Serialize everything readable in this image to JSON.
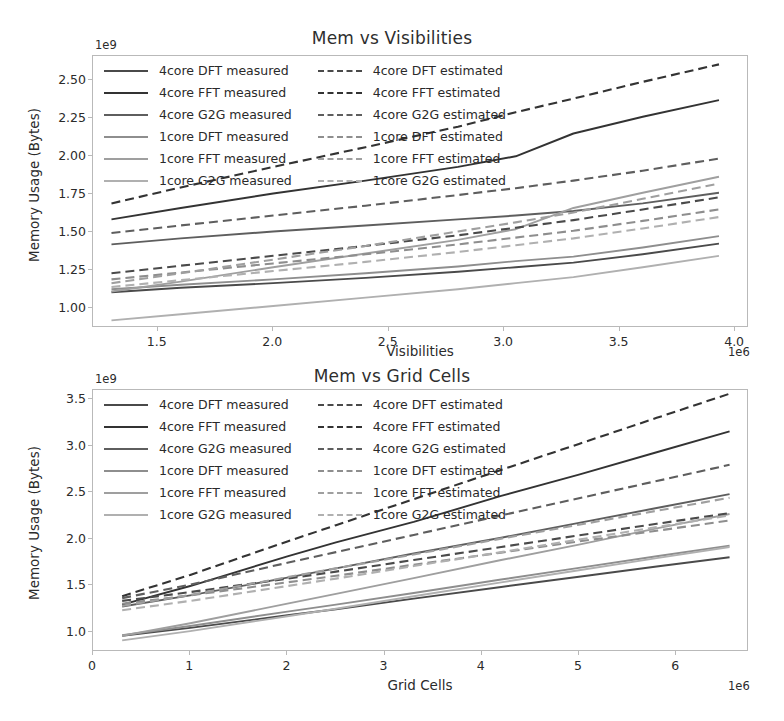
{
  "figure": {
    "figure_title": "Memory scaling plots",
    "axis_label_y": "Memory Usage (Bytes)"
  },
  "charts": [
    {
      "id": "visibilities",
      "title": "Mem vs Visibilities",
      "xlabel": "Visibilities",
      "ylabel": "Memory Usage (Bytes)",
      "y_offset_text": "1e9",
      "x_offset_text": "1e6",
      "yticks": [
        "1.00",
        "1.25",
        "1.50",
        "1.75",
        "2.00",
        "2.25",
        "2.50"
      ],
      "xticks": [
        "1.5",
        "2.0",
        "2.5",
        "3.0",
        "3.5",
        "4.0"
      ],
      "legend": [
        {
          "label": "4core DFT measured",
          "style": "solid",
          "color": "#4a4a4a"
        },
        {
          "label": "4core FFT measured",
          "style": "solid",
          "color": "#333333"
        },
        {
          "label": "4core G2G measured",
          "style": "solid",
          "color": "#5e5e5e"
        },
        {
          "label": "1core DFT measured",
          "style": "solid",
          "color": "#8e8e8e"
        },
        {
          "label": "1core FFT measured",
          "style": "solid",
          "color": "#9f9f9f"
        },
        {
          "label": "1core G2G measured",
          "style": "solid",
          "color": "#b0b0b0"
        },
        {
          "label": "4core DFT estimated",
          "style": "dashed",
          "color": "#4a4a4a"
        },
        {
          "label": "4core FFT estimated",
          "style": "dashed",
          "color": "#333333"
        },
        {
          "label": "4core G2G estimated",
          "style": "dashed",
          "color": "#5e5e5e"
        },
        {
          "label": "1core DFT estimated",
          "style": "dashed",
          "color": "#8e8e8e"
        },
        {
          "label": "1core FFT estimated",
          "style": "dashed",
          "color": "#9f9f9f"
        },
        {
          "label": "1core G2G estimated",
          "style": "dashed",
          "color": "#b0b0b0"
        }
      ]
    },
    {
      "id": "gridcells",
      "title": "Mem vs Grid Cells",
      "xlabel": "Grid Cells",
      "ylabel": "Memory Usage (Bytes)",
      "y_offset_text": "1e9",
      "x_offset_text": "1e6",
      "yticks": [
        "1.0",
        "1.5",
        "2.0",
        "2.5",
        "3.0",
        "3.5"
      ],
      "xticks": [
        "0",
        "1",
        "2",
        "3",
        "4",
        "5",
        "6"
      ],
      "legend": [
        {
          "label": "4core DFT measured",
          "style": "solid",
          "color": "#4a4a4a"
        },
        {
          "label": "4core FFT measured",
          "style": "solid",
          "color": "#333333"
        },
        {
          "label": "4core G2G measured",
          "style": "solid",
          "color": "#5e5e5e"
        },
        {
          "label": "1core DFT measured",
          "style": "solid",
          "color": "#8e8e8e"
        },
        {
          "label": "1core FFT measured",
          "style": "solid",
          "color": "#9f9f9f"
        },
        {
          "label": "1core G2G measured",
          "style": "solid",
          "color": "#b0b0b0"
        },
        {
          "label": "4core DFT estimated",
          "style": "dashed",
          "color": "#4a4a4a"
        },
        {
          "label": "4core FFT estimated",
          "style": "dashed",
          "color": "#333333"
        },
        {
          "label": "4core G2G estimated",
          "style": "dashed",
          "color": "#5e5e5e"
        },
        {
          "label": "1core DFT estimated",
          "style": "dashed",
          "color": "#8e8e8e"
        },
        {
          "label": "1core FFT estimated",
          "style": "dashed",
          "color": "#9f9f9f"
        },
        {
          "label": "1core G2G estimated",
          "style": "dashed",
          "color": "#b0b0b0"
        }
      ]
    }
  ],
  "chart_data": [
    {
      "type": "line",
      "title": "Mem vs Visibilities",
      "xlabel": "Visibilities",
      "ylabel": "Memory Usage (Bytes)",
      "x_offset": "1e6",
      "y_offset": "1e9",
      "xlim": [
        1.22,
        4.06
      ],
      "ylim": [
        0.87,
        2.66
      ],
      "xticks": [
        1.5,
        2.0,
        2.5,
        3.0,
        3.5,
        4.0
      ],
      "yticks": [
        1.0,
        1.25,
        1.5,
        1.75,
        2.0,
        2.25,
        2.5
      ],
      "grid": false,
      "legend_position": "upper-left",
      "x": [
        1.3,
        1.6,
        2.0,
        2.4,
        2.8,
        3.05,
        3.3,
        3.6,
        3.93
      ],
      "series": [
        {
          "name": "4core DFT measured",
          "style": "solid",
          "color": "#4a4a4a",
          "values": [
            1.105,
            1.135,
            1.165,
            1.2,
            1.24,
            1.27,
            1.3,
            1.355,
            1.425
          ]
        },
        {
          "name": "4core FFT measured",
          "style": "solid",
          "color": "#333333",
          "values": [
            1.585,
            1.66,
            1.755,
            1.84,
            1.93,
            2.0,
            2.15,
            2.26,
            2.37
          ]
        },
        {
          "name": "4core G2G measured",
          "style": "solid",
          "color": "#5e5e5e",
          "values": [
            1.42,
            1.46,
            1.505,
            1.545,
            1.585,
            1.61,
            1.64,
            1.69,
            1.76
          ]
        },
        {
          "name": "1core DFT measured",
          "style": "solid",
          "color": "#8e8e8e",
          "values": [
            1.125,
            1.155,
            1.19,
            1.23,
            1.275,
            1.31,
            1.34,
            1.4,
            1.475
          ]
        },
        {
          "name": "1core FFT measured",
          "style": "solid",
          "color": "#9f9f9f",
          "values": [
            1.11,
            1.175,
            1.27,
            1.36,
            1.45,
            1.52,
            1.66,
            1.76,
            1.865
          ]
        },
        {
          "name": "1core G2G measured",
          "style": "solid",
          "color": "#b0b0b0",
          "values": [
            0.92,
            0.96,
            1.015,
            1.07,
            1.125,
            1.165,
            1.205,
            1.27,
            1.345
          ]
        },
        {
          "name": "4core DFT estimated",
          "style": "dashed",
          "color": "#4a4a4a",
          "values": [
            1.23,
            1.28,
            1.345,
            1.41,
            1.48,
            1.53,
            1.58,
            1.65,
            1.73
          ]
        },
        {
          "name": "4core FFT estimated",
          "style": "dashed",
          "color": "#333333",
          "values": [
            1.69,
            1.795,
            1.93,
            2.06,
            2.195,
            2.29,
            2.38,
            2.49,
            2.605
          ]
        },
        {
          "name": "4core G2G estimated",
          "style": "dashed",
          "color": "#5e5e5e",
          "values": [
            1.495,
            1.545,
            1.61,
            1.675,
            1.745,
            1.79,
            1.84,
            1.905,
            1.985
          ]
        },
        {
          "name": "1core DFT estimated",
          "style": "dashed",
          "color": "#8e8e8e",
          "values": [
            1.19,
            1.235,
            1.295,
            1.355,
            1.42,
            1.465,
            1.51,
            1.575,
            1.65
          ]
        },
        {
          "name": "1core FFT estimated",
          "style": "dashed",
          "color": "#9f9f9f",
          "values": [
            1.165,
            1.23,
            1.32,
            1.41,
            1.505,
            1.565,
            1.63,
            1.72,
            1.82
          ]
        },
        {
          "name": "1core G2G estimated",
          "style": "dashed",
          "color": "#b0b0b0",
          "values": [
            1.14,
            1.185,
            1.245,
            1.305,
            1.37,
            1.415,
            1.46,
            1.525,
            1.6
          ]
        }
      ]
    },
    {
      "type": "line",
      "title": "Mem vs Grid Cells",
      "xlabel": "Grid Cells",
      "ylabel": "Memory Usage (Bytes)",
      "x_offset": "1e6",
      "y_offset": "1e9",
      "xlim": [
        0.0,
        6.75
      ],
      "ylim": [
        0.78,
        3.6
      ],
      "xticks": [
        0,
        1,
        2,
        3,
        4,
        5,
        6
      ],
      "yticks": [
        1.0,
        1.5,
        2.0,
        2.5,
        3.0,
        3.5
      ],
      "grid": false,
      "legend_position": "upper-left",
      "x": [
        0.3,
        1.0,
        2.0,
        2.5,
        3.3,
        4.2,
        5.0,
        5.8,
        6.55
      ],
      "series": [
        {
          "name": "4core DFT measured",
          "style": "solid",
          "color": "#4a4a4a",
          "values": [
            0.955,
            1.04,
            1.175,
            1.24,
            1.355,
            1.48,
            1.59,
            1.7,
            1.8
          ]
        },
        {
          "name": "4core FFT measured",
          "style": "solid",
          "color": "#333333",
          "values": [
            1.29,
            1.49,
            1.81,
            1.96,
            2.18,
            2.46,
            2.69,
            2.93,
            3.155
          ]
        },
        {
          "name": "4core G2G measured",
          "style": "solid",
          "color": "#5e5e5e",
          "values": [
            1.27,
            1.39,
            1.58,
            1.68,
            1.84,
            2.01,
            2.17,
            2.33,
            2.48
          ]
        },
        {
          "name": "1core DFT measured",
          "style": "solid",
          "color": "#8e8e8e",
          "values": [
            0.96,
            1.06,
            1.215,
            1.29,
            1.415,
            1.56,
            1.685,
            1.81,
            1.925
          ]
        },
        {
          "name": "1core FFT measured",
          "style": "solid",
          "color": "#9f9f9f",
          "values": [
            0.955,
            1.09,
            1.3,
            1.405,
            1.575,
            1.77,
            1.935,
            2.11,
            2.265
          ]
        },
        {
          "name": "1core G2G measured",
          "style": "solid",
          "color": "#b0b0b0",
          "values": [
            0.905,
            1.005,
            1.165,
            1.245,
            1.38,
            1.53,
            1.66,
            1.79,
            1.91
          ]
        },
        {
          "name": "4core DFT estimated",
          "style": "dashed",
          "color": "#4a4a4a",
          "values": [
            1.33,
            1.425,
            1.57,
            1.645,
            1.77,
            1.91,
            2.035,
            2.16,
            2.275
          ]
        },
        {
          "name": "4core FFT estimated",
          "style": "dashed",
          "color": "#333333",
          "values": [
            1.38,
            1.61,
            1.97,
            2.145,
            2.425,
            2.74,
            3.02,
            3.3,
            3.56
          ]
        },
        {
          "name": "4core G2G estimated",
          "style": "dashed",
          "color": "#5e5e5e",
          "values": [
            1.36,
            1.505,
            1.74,
            1.855,
            2.04,
            2.25,
            2.435,
            2.62,
            2.795
          ]
        },
        {
          "name": "1core DFT estimated",
          "style": "dashed",
          "color": "#8e8e8e",
          "values": [
            1.3,
            1.39,
            1.53,
            1.6,
            1.72,
            1.85,
            1.97,
            2.085,
            2.195
          ]
        },
        {
          "name": "1core FFT estimated",
          "style": "dashed",
          "color": "#9f9f9f",
          "values": [
            1.275,
            1.395,
            1.585,
            1.68,
            1.83,
            2.0,
            2.15,
            2.3,
            2.44
          ]
        },
        {
          "name": "1core G2G estimated",
          "style": "dashed",
          "color": "#b0b0b0",
          "values": [
            1.23,
            1.33,
            1.49,
            1.57,
            1.705,
            1.855,
            1.99,
            2.125,
            2.25
          ]
        }
      ]
    }
  ]
}
